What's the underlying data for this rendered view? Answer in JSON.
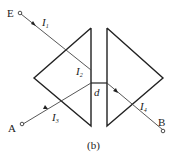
{
  "figure": {
    "caption": "(b)",
    "colors": {
      "prism": "#222222",
      "ray": "#444444",
      "background": "#ffffff"
    }
  },
  "points": {
    "E": {
      "label": "E"
    },
    "A": {
      "label": "A"
    },
    "B": {
      "label": "B"
    }
  },
  "rays": [
    {
      "name": "I",
      "sub": "1"
    },
    {
      "name": "I",
      "sub": "2"
    },
    {
      "name": "I",
      "sub": "3"
    },
    {
      "name": "I",
      "sub": "4"
    }
  ],
  "gap": {
    "label": "d"
  }
}
